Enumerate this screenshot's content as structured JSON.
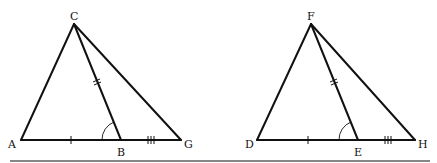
{
  "diagram": {
    "type": "geometry-congruent-triangles",
    "figures": [
      {
        "id": "left",
        "points": {
          "C": {
            "label": "C",
            "x": 74,
            "y": 24,
            "lx": 70,
            "ly": 20
          },
          "A": {
            "label": "A",
            "x": 21,
            "y": 140,
            "lx": 8,
            "ly": 148
          },
          "B": {
            "label": "B",
            "x": 121,
            "y": 140,
            "lx": 117,
            "ly": 156
          },
          "G": {
            "label": "G",
            "x": 181,
            "y": 140,
            "lx": 184,
            "ly": 148
          }
        },
        "segments": [
          "CA",
          "CB",
          "CG",
          "AG"
        ],
        "marks": {
          "AB": "single-tick",
          "BG": "triple-tick",
          "CB": "double-tick",
          "angle_CBA": "arc"
        }
      },
      {
        "id": "right",
        "points": {
          "F": {
            "label": "F",
            "x": 311,
            "y": 24,
            "lx": 307,
            "ly": 20
          },
          "D": {
            "label": "D",
            "x": 257,
            "y": 140,
            "lx": 245,
            "ly": 148
          },
          "E": {
            "label": "E",
            "x": 358,
            "y": 140,
            "lx": 354,
            "ly": 156
          },
          "H": {
            "label": "H",
            "x": 415,
            "y": 140,
            "lx": 418,
            "ly": 148
          }
        },
        "segments": [
          "FD",
          "FE",
          "FH",
          "DH"
        ],
        "marks": {
          "DE": "single-tick",
          "EH": "triple-tick",
          "FE": "double-tick",
          "angle_FED": "arc"
        }
      }
    ],
    "labels": {
      "C": "C",
      "A": "A",
      "B": "B",
      "G": "G",
      "F": "F",
      "D": "D",
      "E": "E",
      "H": "H"
    }
  }
}
